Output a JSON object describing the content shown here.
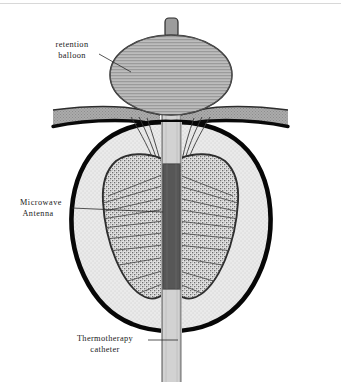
{
  "figure": {
    "kind": "medical-anatomical-diagram",
    "background_color": "#ffffff",
    "width": 341,
    "height": 384
  },
  "labels": {
    "balloon": {
      "line1": "retention",
      "line2": "balloon"
    },
    "antenna": {
      "line1": "Microwave",
      "line2": "Antenna"
    },
    "catheter": {
      "line1": "Thermotherapy",
      "line2": "catheter"
    }
  },
  "parts": {
    "retention_balloon": {
      "name": "retention balloon",
      "fill": "#b4b4b4",
      "stroke": "#2a2a2a",
      "pattern": "horizontal-hatch"
    },
    "balloon_stem": {
      "name": "balloon stem",
      "fill": "#9a9a9a",
      "stroke": "#2a2a2a"
    },
    "bladder_wall": {
      "name": "bladder wall",
      "fill": "#a9a9a9",
      "stroke": "#111111"
    },
    "prostate_capsule": {
      "name": "prostate capsule",
      "fill": "#e8e8e8",
      "stroke": "#0d0d0d",
      "stroke_width": 4.5
    },
    "prostate_lobe_left": {
      "name": "left prostate lobe",
      "fill": "#d6d6d6",
      "stroke": "#3a3a3a",
      "pattern": "stipple"
    },
    "prostate_lobe_right": {
      "name": "right prostate lobe",
      "fill": "#d6d6d6",
      "stroke": "#3a3a3a",
      "pattern": "stipple"
    },
    "microwave_antenna": {
      "name": "microwave antenna",
      "fill": "#555555",
      "stroke": "#333333"
    },
    "catheter_shaft": {
      "name": "thermotherapy catheter shaft",
      "fill": "#d0d0d0",
      "stroke": "#8a8a8a"
    },
    "heat_rays": {
      "name": "microwave heat radiation lines",
      "stroke": "#4a4a4a",
      "count": 18
    }
  },
  "colors": {
    "ink": "#1a1a1a",
    "capsule_outline": "#0d0d0d",
    "tissue_light": "#e8e8e8",
    "tissue_mid": "#d6d6d6",
    "tissue_dark": "#a9a9a9",
    "antenna_dark": "#555555",
    "top_rule": "#d8d8d8"
  }
}
